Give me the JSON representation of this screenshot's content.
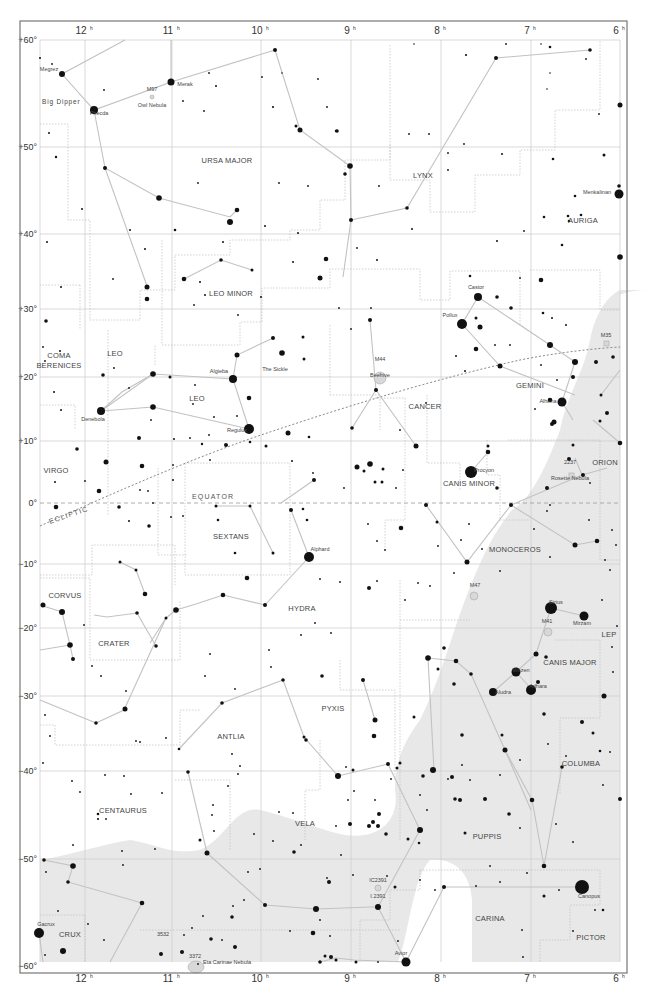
{
  "chart": {
    "frame": {
      "x": 23,
      "y": 22,
      "w": 615,
      "h": 946
    },
    "plot": {
      "x0": 40,
      "x1": 620,
      "y0": 40,
      "y1": 962
    },
    "ra_ticks": [
      {
        "label": "12",
        "sup": "h",
        "x": 85
      },
      {
        "label": "11",
        "sup": "h",
        "x": 172
      },
      {
        "label": "10",
        "sup": "h",
        "x": 261
      },
      {
        "label": "9",
        "sup": "h",
        "x": 351
      },
      {
        "label": "8",
        "sup": "h",
        "x": 441
      },
      {
        "label": "7",
        "sup": "h",
        "x": 531
      },
      {
        "label": "6",
        "sup": "h",
        "x": 620
      }
    ],
    "dec_ticks": [
      {
        "label": "+60°",
        "y": 40
      },
      {
        "label": "+50°",
        "y": 147
      },
      {
        "label": "+40°",
        "y": 234
      },
      {
        "label": "+30°",
        "y": 309
      },
      {
        "label": "+20°",
        "y": 377
      },
      {
        "label": "+10°",
        "y": 441
      },
      {
        "label": "0°",
        "y": 503
      },
      {
        "label": "−10°",
        "y": 564
      },
      {
        "label": "−20°",
        "y": 628
      },
      {
        "label": "−30°",
        "y": 696
      },
      {
        "label": "−40°",
        "y": 771
      },
      {
        "label": "−50°",
        "y": 859
      },
      {
        "label": "−60°",
        "y": 966
      }
    ],
    "lines": {
      "equator_label": "EQUATOR",
      "ecliptic_label": "ECLIPTIC"
    },
    "constellations": [
      {
        "name": "URSA MAJOR",
        "x": 227,
        "y": 163
      },
      {
        "name": "LYNX",
        "x": 423,
        "y": 178
      },
      {
        "name": "AURIGA",
        "x": 583,
        "y": 223
      },
      {
        "name": "LEO MINOR",
        "x": 231,
        "y": 296
      },
      {
        "name": "COMA",
        "x": 59,
        "y": 358
      },
      {
        "name": "BERENICES",
        "x": 59,
        "y": 368
      },
      {
        "name": "LEO",
        "x": 115,
        "y": 356
      },
      {
        "name": "LEO",
        "x": 197,
        "y": 401
      },
      {
        "name": "GEMINI",
        "x": 530,
        "y": 388
      },
      {
        "name": "CANCER",
        "x": 425,
        "y": 409
      },
      {
        "name": "VIRGO",
        "x": 56,
        "y": 473
      },
      {
        "name": "CANIS MINOR",
        "x": 469,
        "y": 486
      },
      {
        "name": "ORION",
        "x": 605,
        "y": 465
      },
      {
        "name": "SEXTANS",
        "x": 231,
        "y": 539
      },
      {
        "name": "MONOCEROS",
        "x": 515,
        "y": 552
      },
      {
        "name": "HYDRA",
        "x": 302,
        "y": 611
      },
      {
        "name": "CORVUS",
        "x": 65,
        "y": 598
      },
      {
        "name": "CRATER",
        "x": 114,
        "y": 646
      },
      {
        "name": "CANIS MAJOR",
        "x": 570,
        "y": 665
      },
      {
        "name": "LEP",
        "x": 609,
        "y": 637
      },
      {
        "name": "PYXIS",
        "x": 333,
        "y": 711
      },
      {
        "name": "ANTLIA",
        "x": 231,
        "y": 739
      },
      {
        "name": "COLUMBA",
        "x": 581,
        "y": 766
      },
      {
        "name": "CENTAURUS",
        "x": 123,
        "y": 813
      },
      {
        "name": "VELA",
        "x": 305,
        "y": 826
      },
      {
        "name": "PUPPIS",
        "x": 487,
        "y": 839
      },
      {
        "name": "CARINA",
        "x": 490,
        "y": 921
      },
      {
        "name": "PICTOR",
        "x": 591,
        "y": 940
      },
      {
        "name": "CRUX",
        "x": 70,
        "y": 937
      }
    ],
    "named_stars": [
      {
        "name": "Megrez",
        "x": 49,
        "y": 71,
        "sx": 62,
        "sy": 74,
        "r": 3
      },
      {
        "name": "Phecda",
        "x": 99,
        "y": 115,
        "sx": 94,
        "sy": 110,
        "r": 4
      },
      {
        "name": "Merak",
        "x": 185,
        "y": 86,
        "sx": 171,
        "sy": 82,
        "r": 3.5
      },
      {
        "name": "Menkalinan",
        "x": 597,
        "y": 194,
        "sx": 619,
        "sy": 194,
        "r": 4.5
      },
      {
        "name": "Castor",
        "x": 476,
        "y": 289,
        "sx": 478,
        "sy": 297,
        "r": 4
      },
      {
        "name": "Pollux",
        "x": 450,
        "y": 317,
        "sx": 462,
        "sy": 324,
        "r": 5
      },
      {
        "name": "Algieba",
        "x": 219,
        "y": 373,
        "sx": 233,
        "sy": 379,
        "r": 4
      },
      {
        "name": "The Sickle",
        "x": 275,
        "y": 371,
        "sx": null,
        "sy": null,
        "r": 0
      },
      {
        "name": "Denebola",
        "x": 93,
        "y": 421,
        "sx": 101,
        "sy": 411,
        "r": 4
      },
      {
        "name": "Regulus",
        "x": 237,
        "y": 432,
        "sx": 249,
        "sy": 429,
        "r": 5
      },
      {
        "name": "Alhena",
        "x": 548,
        "y": 403,
        "sx": 562,
        "sy": 402,
        "r": 4.5
      },
      {
        "name": "Procyon",
        "x": 484,
        "y": 472,
        "sx": 471,
        "sy": 472,
        "r": 6
      },
      {
        "name": "Alphard",
        "x": 320,
        "y": 551,
        "sx": 309,
        "sy": 557,
        "r": 5
      },
      {
        "name": "Sirius",
        "x": 556,
        "y": 604,
        "sx": 551,
        "sy": 608,
        "r": 6
      },
      {
        "name": "Mirzam",
        "x": 582,
        "y": 625,
        "sx": 584,
        "sy": 616,
        "r": 4.5
      },
      {
        "name": "Wezen",
        "x": 521,
        "y": 672,
        "sx": 516,
        "sy": 672,
        "r": 4.5
      },
      {
        "name": "Adhara",
        "x": 538,
        "y": 688,
        "sx": 531,
        "sy": 690,
        "r": 5
      },
      {
        "name": "Aludra",
        "x": 503,
        "y": 694,
        "sx": 493,
        "sy": 692,
        "r": 4
      },
      {
        "name": "Canopus",
        "x": 589,
        "y": 898,
        "sx": 582,
        "sy": 887,
        "r": 7
      },
      {
        "name": "Gacrux",
        "x": 46,
        "y": 926,
        "sx": 39,
        "sy": 933,
        "r": 5
      },
      {
        "name": "Avior",
        "x": 401,
        "y": 955,
        "sx": 406,
        "sy": 962,
        "r": 4.5
      }
    ],
    "deep_sky": [
      {
        "id": "M97",
        "label": "Owl Nebula",
        "x": 152,
        "y": 97
      },
      {
        "id": "M44",
        "label": "Beehive",
        "x": 380,
        "y": 367
      },
      {
        "id": "M35",
        "label": "",
        "x": 606,
        "y": 343
      },
      {
        "id": "2237",
        "label": "Rosette Nebula",
        "x": 570,
        "y": 470
      },
      {
        "id": "M47",
        "label": "",
        "x": 475,
        "y": 593
      },
      {
        "id": "M41",
        "label": "",
        "x": 547,
        "y": 629
      },
      {
        "id": "3532",
        "label": "",
        "x": 163,
        "y": 942
      },
      {
        "id": "3372",
        "label": "Eta Carinae Nebula",
        "x": 195,
        "y": 964
      },
      {
        "id": "IC2391",
        "label": "I.2391",
        "x": 378,
        "y": 888
      }
    ],
    "milky_way_color": "#e8e8e8",
    "line_color": "#c2c2c2",
    "grid_color": "#cfcfcf"
  }
}
